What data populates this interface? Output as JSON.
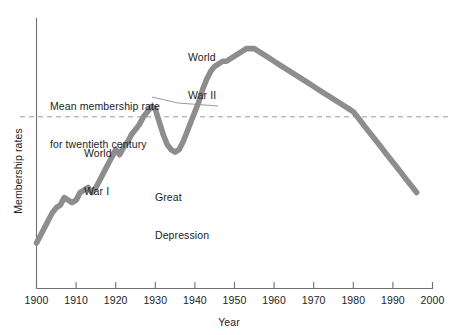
{
  "chart_data": {
    "type": "line",
    "title": "",
    "xlabel": "Year",
    "ylabel": "Membership rates",
    "xlim": [
      1900,
      2000
    ],
    "ylim": [
      0,
      100
    ],
    "grid": false,
    "legend": "none",
    "xticks": [
      1900,
      1910,
      1920,
      1930,
      1940,
      1950,
      1960,
      1970,
      1980,
      1990,
      2000
    ],
    "xticklabels": [
      "1900",
      "1910",
      "1920",
      "1930",
      "1940",
      "1950",
      "1960",
      "1970",
      "1980",
      "1990",
      "2000"
    ],
    "yticks": [],
    "yticklabels": [],
    "series": [
      {
        "name": "Membership rate",
        "color": "#8d8d8d",
        "x": [
          1900,
          1901,
          1902,
          1903,
          1904,
          1905,
          1906,
          1907,
          1908,
          1909,
          1910,
          1911,
          1912,
          1913,
          1914,
          1915,
          1916,
          1917,
          1918,
          1919,
          1920,
          1921,
          1922,
          1923,
          1924,
          1925,
          1926,
          1927,
          1928,
          1929,
          1930,
          1931,
          1932,
          1933,
          1934,
          1935,
          1936,
          1937,
          1938,
          1939,
          1940,
          1941,
          1942,
          1943,
          1944,
          1945,
          1946,
          1947,
          1948,
          1949,
          1950,
          1951,
          1952,
          1953,
          1954,
          1955,
          1956,
          1957,
          1958,
          1959,
          1960,
          1961,
          1962,
          1963,
          1964,
          1965,
          1966,
          1967,
          1968,
          1969,
          1970,
          1971,
          1972,
          1973,
          1974,
          1975,
          1976,
          1977,
          1978,
          1979,
          1980,
          1981,
          1982,
          1983,
          1984,
          1985,
          1986,
          1987,
          1988,
          1989,
          1990,
          1991,
          1992,
          1993,
          1994,
          1995,
          1996
        ],
        "y": [
          18,
          21,
          24,
          27,
          30,
          32,
          33,
          36,
          35,
          34,
          35,
          38,
          39,
          40,
          38,
          40,
          43,
          46,
          49,
          52,
          55,
          53,
          56,
          58,
          61,
          63,
          65,
          68,
          70,
          72,
          71,
          66,
          61,
          57,
          55,
          54,
          55,
          58,
          62,
          66,
          70,
          74,
          79,
          83,
          86,
          88,
          89,
          90,
          90,
          91,
          92,
          93,
          94,
          95,
          95,
          95,
          94,
          93,
          92,
          91,
          90,
          89,
          88,
          87,
          86,
          85,
          84,
          83,
          82,
          81,
          80,
          79,
          78,
          77,
          76,
          75,
          74,
          73,
          72,
          71,
          70,
          68,
          66,
          64,
          62,
          60,
          58,
          56,
          54,
          52,
          50,
          48,
          46,
          44,
          42,
          40,
          38
        ]
      }
    ],
    "reference_line": {
      "label": "Mean membership rate for twentieth century",
      "style": "dashed",
      "orientation": "horizontal",
      "color": "#9a9a9a",
      "value": 68
    },
    "annotations": [
      {
        "id": "ww2",
        "text": "World\nWar II",
        "line1": "World",
        "line2": "War II"
      },
      {
        "id": "mean",
        "text": "Mean membership rate\nfor twentieth century",
        "line1": "Mean membership rate",
        "line2": "for twentieth century"
      },
      {
        "id": "ww1",
        "text": "World\nWar I",
        "line1": "World",
        "line2": "War I"
      },
      {
        "id": "depression",
        "text": "Great\nDepression",
        "line1": "Great",
        "line2": "Depression"
      }
    ]
  },
  "axes": {
    "x_axis_label": "Year",
    "y_axis_label": "Membership rates"
  },
  "colors": {
    "line": "#8d8d8d",
    "axis": "#6f6f6f",
    "dashed": "#9a9a9a",
    "text": "#1d1d1d",
    "background": "#ffffff"
  }
}
